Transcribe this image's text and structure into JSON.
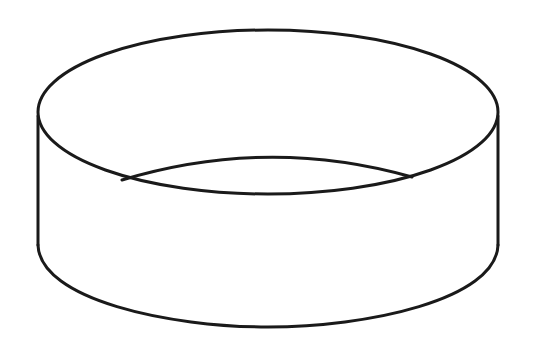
{
  "diagram": {
    "stroke_color": "#1a1a1a",
    "background": "#ffffff",
    "parts": [
      "top-rim-ellipse",
      "inner-back-edge",
      "left-side-edge",
      "right-side-edge",
      "bottom-front-arc"
    ]
  }
}
